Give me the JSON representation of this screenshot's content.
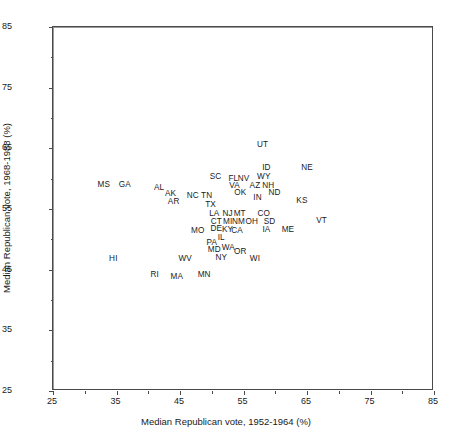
{
  "chart_data": {
    "type": "scatter",
    "title": "",
    "xlabel": "Median Republican vote, 1952-1964 (%)",
    "ylabel": "Median Republican vote, 1968-1988 (%)",
    "xlim": [
      25,
      85
    ],
    "ylim": [
      25,
      85
    ],
    "xticks": [
      25,
      35,
      45,
      55,
      65,
      75,
      85
    ],
    "yticks": [
      25,
      35,
      45,
      55,
      65,
      75,
      85
    ],
    "xtick_labels": [
      "25",
      "35",
      "45",
      "55",
      "65",
      "75",
      "85"
    ],
    "ytick_labels": [
      "25",
      "35",
      "45",
      "55",
      "65",
      "75",
      "85"
    ],
    "minor_tick_step": 5,
    "grid": false,
    "legend": "none",
    "reference_lines": [
      {
        "axis": "x",
        "value": 55,
        "color": "#9a9a9a"
      },
      {
        "axis": "y",
        "value": 55,
        "color": "#9a9a9a"
      }
    ],
    "point_style": "text-label",
    "points": [
      {
        "label": "MS",
        "x": 33.0,
        "y": 59.0
      },
      {
        "label": "GA",
        "x": 36.3,
        "y": 59.0
      },
      {
        "label": "AL",
        "x": 41.7,
        "y": 58.4
      },
      {
        "label": "AK",
        "x": 43.5,
        "y": 57.4
      },
      {
        "label": "AR",
        "x": 44.0,
        "y": 56.2
      },
      {
        "label": "NC",
        "x": 47.0,
        "y": 57.2
      },
      {
        "label": "TN",
        "x": 49.2,
        "y": 57.2
      },
      {
        "label": "TX",
        "x": 49.8,
        "y": 55.6
      },
      {
        "label": "SC",
        "x": 50.6,
        "y": 60.2
      },
      {
        "label": "FL",
        "x": 53.4,
        "y": 60.0
      },
      {
        "label": "NV",
        "x": 55.0,
        "y": 60.0
      },
      {
        "label": "VA",
        "x": 53.6,
        "y": 58.8
      },
      {
        "label": "OK",
        "x": 54.5,
        "y": 57.6
      },
      {
        "label": "ID",
        "x": 58.6,
        "y": 61.8
      },
      {
        "label": "WY",
        "x": 58.2,
        "y": 60.2
      },
      {
        "label": "AZ",
        "x": 56.8,
        "y": 58.8
      },
      {
        "label": "NH",
        "x": 58.9,
        "y": 58.8
      },
      {
        "label": "ND",
        "x": 59.9,
        "y": 57.6
      },
      {
        "label": "IN",
        "x": 57.2,
        "y": 56.8
      },
      {
        "label": "UT",
        "x": 58.0,
        "y": 65.6
      },
      {
        "label": "NE",
        "x": 65.0,
        "y": 61.8
      },
      {
        "label": "KS",
        "x": 64.2,
        "y": 56.4
      },
      {
        "label": "LA",
        "x": 50.4,
        "y": 54.2
      },
      {
        "label": "NJ",
        "x": 52.5,
        "y": 54.2
      },
      {
        "label": "MT",
        "x": 54.4,
        "y": 54.2
      },
      {
        "label": "CO",
        "x": 58.2,
        "y": 54.2
      },
      {
        "label": "CT",
        "x": 50.7,
        "y": 52.8
      },
      {
        "label": "MI",
        "x": 52.5,
        "y": 52.8
      },
      {
        "label": "NM",
        "x": 54.2,
        "y": 52.8
      },
      {
        "label": "OH",
        "x": 56.3,
        "y": 52.8
      },
      {
        "label": "SD",
        "x": 59.1,
        "y": 52.9
      },
      {
        "label": "IA",
        "x": 58.6,
        "y": 51.6
      },
      {
        "label": "ME",
        "x": 62.0,
        "y": 51.6
      },
      {
        "label": "VT",
        "x": 67.3,
        "y": 53.0
      },
      {
        "label": "MO",
        "x": 47.8,
        "y": 51.4
      },
      {
        "label": "DE",
        "x": 50.7,
        "y": 51.7
      },
      {
        "label": "KY",
        "x": 52.5,
        "y": 51.6
      },
      {
        "label": "CA",
        "x": 54.0,
        "y": 51.3
      },
      {
        "label": "IL",
        "x": 51.5,
        "y": 50.3
      },
      {
        "label": "PA",
        "x": 50.0,
        "y": 49.4
      },
      {
        "label": "MD",
        "x": 50.4,
        "y": 48.3
      },
      {
        "label": "WA",
        "x": 52.6,
        "y": 48.5
      },
      {
        "label": "OR",
        "x": 54.5,
        "y": 47.9
      },
      {
        "label": "NY",
        "x": 51.5,
        "y": 47.0
      },
      {
        "label": "WI",
        "x": 56.8,
        "y": 46.8
      },
      {
        "label": "WV",
        "x": 45.8,
        "y": 46.8
      },
      {
        "label": "HI",
        "x": 34.5,
        "y": 46.8
      },
      {
        "label": "RI",
        "x": 41.0,
        "y": 44.2
      },
      {
        "label": "MA",
        "x": 44.5,
        "y": 43.8
      },
      {
        "label": "MN",
        "x": 48.8,
        "y": 44.2
      }
    ]
  }
}
